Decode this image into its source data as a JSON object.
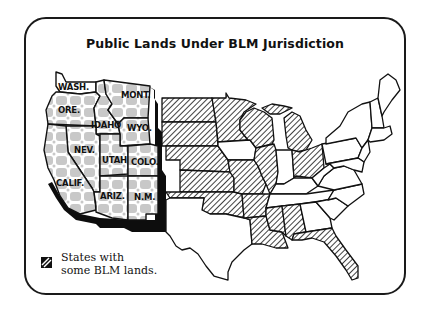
{
  "title": "Public Lands Under BLM Jurisdiction",
  "legend": {
    "swatch_icon": "diagonal-hatch-icon",
    "line1": "States with",
    "line2": "some BLM lands."
  },
  "map": {
    "western_states_major_blm": [
      {
        "id": "WA",
        "label": "WASH."
      },
      {
        "id": "OR",
        "label": "ORE."
      },
      {
        "id": "ID",
        "label": "IDAHO"
      },
      {
        "id": "MT",
        "label": "MONT."
      },
      {
        "id": "WY",
        "label": "WYO."
      },
      {
        "id": "NV",
        "label": "NEV."
      },
      {
        "id": "UT",
        "label": "UTAH"
      },
      {
        "id": "CO",
        "label": "COLO."
      },
      {
        "id": "CA",
        "label": "CALIF."
      },
      {
        "id": "AZ",
        "label": "ARIZ."
      },
      {
        "id": "NM",
        "label": "N.M."
      }
    ],
    "hatched_states": [
      "ND",
      "SD",
      "NE",
      "KS",
      "OK",
      "MN",
      "IA",
      "MO",
      "AR",
      "LA",
      "WI",
      "IL",
      "MI",
      "OH",
      "MS",
      "AL",
      "FL"
    ],
    "colors": {
      "outline": "#111111",
      "blm_land_gray": "#c8c8c8",
      "shadow": "#0d0d0d",
      "background": "#ffffff"
    }
  }
}
